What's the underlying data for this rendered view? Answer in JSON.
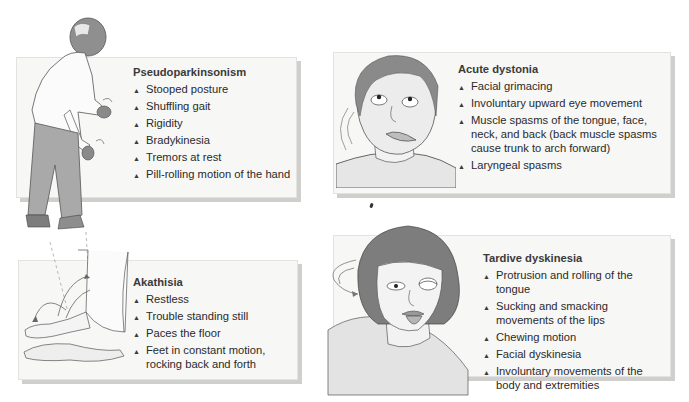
{
  "panels": [
    {
      "id": "pseudoparkinsonism",
      "title": "Pseudoparkinsonism",
      "illustration": "stooped-elderly-man-with-tremoring-hands",
      "items": [
        "Stooped posture",
        "Shuffling gait",
        "Rigidity",
        "Bradykinesia",
        "Tremors at rest",
        "Pill-rolling motion of the hand"
      ]
    },
    {
      "id": "acute-dystonia",
      "title": "Acute dystonia",
      "illustration": "man-face-with-upward-eyes-and-twisted-neck",
      "items": [
        "Facial grimacing",
        "Involuntary upward eye movement",
        "Muscle spasms of the tongue, face, neck, and back (back muscle spasms cause trunk to arch forward)",
        "Laryngeal spasms"
      ]
    },
    {
      "id": "akathisia",
      "title": "Akathisia",
      "illustration": "restless-feet-with-motion-arrows",
      "items": [
        "Restless",
        "Trouble standing still",
        "Paces the floor",
        "Feet in constant motion, rocking back and forth"
      ]
    },
    {
      "id": "tardive-dyskinesia",
      "title": "Tardive dyskinesia",
      "illustration": "woman-face-with-protruding-tongue",
      "items": [
        "Protrusion and rolling of the tongue",
        "Sucking and smacking movements of the lips",
        "Chewing motion",
        "Facial dyskinesia",
        "Involuntary movements of the body and extremities"
      ]
    }
  ],
  "bullet_glyph": "▲",
  "colors": {
    "panel_bg": "#f7f7f6",
    "panel_shadow": "#cfcfcd",
    "text": "#2a2a2a",
    "illustration_gray": "#9a9a9a"
  }
}
